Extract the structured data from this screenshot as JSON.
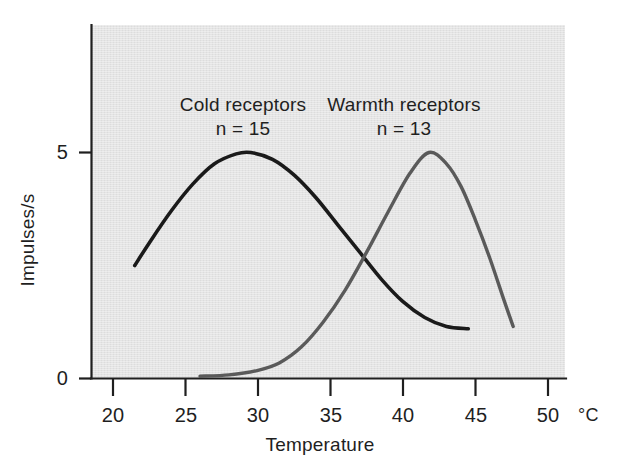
{
  "chart_data": {
    "type": "line",
    "title": "",
    "xlabel": "Temperature",
    "ylabel": "Impulses/s",
    "x_unit": "°C",
    "xlim": [
      18.7,
      51.9
    ],
    "ylim": [
      0,
      7.8
    ],
    "xticks": [
      20,
      25,
      30,
      35,
      40,
      45,
      50
    ],
    "xtick_labels": [
      "20",
      "25",
      "30",
      "35",
      "40",
      "45",
      "50"
    ],
    "yticks": [
      0,
      5
    ],
    "ytick_labels": [
      "0",
      "5"
    ],
    "grid": false,
    "legend_position": "in-plot-annotations",
    "series": [
      {
        "name": "Cold receptors",
        "n_label": "n = 15",
        "color": "#1a1a1a",
        "peak_x": 29.5,
        "peak_y": 5.0,
        "x": [
          21.5,
          22.5,
          24.0,
          25.5,
          27.0,
          28.5,
          29.5,
          31.0,
          32.5,
          34.0,
          35.5,
          37.0,
          38.5,
          40.0,
          41.5,
          43.0,
          44.5
        ],
        "y": [
          2.5,
          3.0,
          3.7,
          4.3,
          4.75,
          4.97,
          5.0,
          4.85,
          4.5,
          4.0,
          3.4,
          2.8,
          2.2,
          1.7,
          1.35,
          1.15,
          1.1
        ]
      },
      {
        "name": "Warmth receptors",
        "n_label": "n = 13",
        "color": "#5a5a5a",
        "peak_x": 41.8,
        "peak_y": 5.0,
        "x": [
          26.0,
          28.0,
          30.0,
          31.5,
          33.0,
          34.5,
          36.0,
          37.5,
          39.0,
          40.5,
          41.8,
          43.0,
          44.0,
          45.0,
          46.0,
          47.0,
          47.6
        ],
        "y": [
          0.05,
          0.08,
          0.18,
          0.35,
          0.7,
          1.25,
          1.95,
          2.8,
          3.7,
          4.55,
          5.0,
          4.75,
          4.25,
          3.5,
          2.65,
          1.7,
          1.15
        ]
      }
    ],
    "annotations": [
      {
        "text": "Cold receptors",
        "sub": "n = 15",
        "at_x": 27.6,
        "at_y": 7.1
      },
      {
        "text": "Warmth receptors",
        "sub": "n = 13",
        "at_x": 38.6,
        "at_y": 7.1
      }
    ]
  },
  "axes": {
    "y_axis_title": "Impulses/s",
    "x_axis_title": "Temperature",
    "x_unit": "°C",
    "ytick_0": "0",
    "ytick_5": "5"
  },
  "colors": {
    "plot_background": "#e4e4e4",
    "page_background": "#ffffff",
    "axis": "#1f1f1f",
    "cold_curve": "#1a1a1a",
    "warmth_curve": "#5a5a5a",
    "text": "#1f1f1f"
  }
}
